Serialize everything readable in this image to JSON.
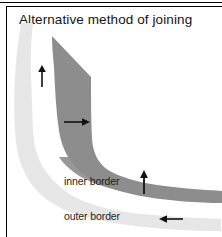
{
  "figure": {
    "title": "Alternative method of joining",
    "labels": {
      "inner": "inner border",
      "outer": "outer border"
    },
    "colors": {
      "inner_band": "#8d8d8d",
      "outer_band": "#e6e6e6",
      "background": "#ffffff",
      "frame": "#000000",
      "arrow": "#111111",
      "text": "#141414"
    },
    "arrows": [
      {
        "name": "arrow-outer-vertical-up",
        "direction": "up",
        "band": "outer"
      },
      {
        "name": "arrow-inner-horizontal-right",
        "direction": "right",
        "band": "inner"
      },
      {
        "name": "arrow-inner-vertical-up",
        "direction": "up",
        "band": "inner"
      },
      {
        "name": "arrow-outer-horizontal-left",
        "direction": "left",
        "band": "outer"
      }
    ]
  }
}
